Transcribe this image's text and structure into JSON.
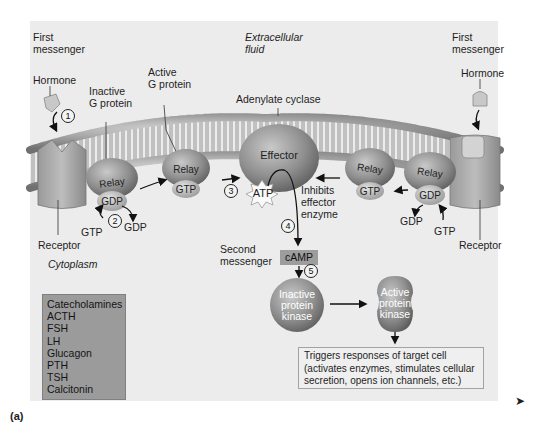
{
  "figure": {
    "panel_label": "(a)",
    "next_arrow": "➤"
  },
  "regions": {
    "extracellular": "Extracellular",
    "extracellular_2": "fluid",
    "cytoplasm": "Cytoplasm"
  },
  "left": {
    "first_messenger_1": "First",
    "first_messenger_2": "messenger",
    "hormone": "Hormone",
    "receptor": "Receptor",
    "inactive_g_1": "Inactive",
    "inactive_g_2": "G protein",
    "active_g_1": "Active",
    "active_g_2": "G protein",
    "relay_inactive": "Relay",
    "gdp_bound": "GDP",
    "gtp_in": "GTP",
    "gdp_out": "GDP",
    "relay_active": "Relay",
    "gtp_bound": "GTP"
  },
  "right": {
    "first_messenger_1": "First",
    "first_messenger_2": "messenger",
    "hormone": "Hormone",
    "receptor": "Receptor",
    "relay_active": "Relay",
    "gtp_bound": "GTP",
    "relay_inactive": "Relay",
    "gdp_bound": "GDP",
    "gdp_out": "GDP",
    "gtp_in": "GTP",
    "inhibits_1": "Inhibits",
    "inhibits_2": "effector",
    "inhibits_3": "enzyme"
  },
  "center": {
    "adenylate_cyclase": "Adenylate cyclase",
    "effector": "Effector",
    "atp": "ATP",
    "second_messenger_1": "Second",
    "second_messenger_2": "messenger",
    "camp": "cAMP",
    "inactive_pk_1": "Inactive",
    "inactive_pk_2": "protein",
    "inactive_pk_3": "kinase",
    "active_pk_1": "Active",
    "active_pk_2": "protein",
    "active_pk_3": "kinase"
  },
  "steps": [
    "1",
    "2",
    "3",
    "4",
    "5"
  ],
  "hormones": [
    "Catecholamines",
    "ACTH",
    "FSH",
    "LH",
    "Glucagon",
    "PTH",
    "TSH",
    "Calcitonin"
  ],
  "triggers": {
    "line1": "Triggers responses of target cell",
    "line2": "(activates enzymes, stimulates cellular",
    "line3": "secretion, opens ion channels, etc.)"
  },
  "colors": {
    "panel_bg": "#ececec",
    "hormone_box": "#9b9b9b",
    "camp_box": "#9d9d9d",
    "protein_gray": "#8a8a8a"
  }
}
